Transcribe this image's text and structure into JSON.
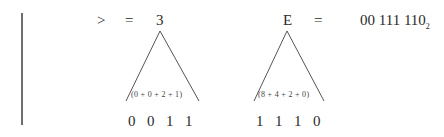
{
  "left_rule": {
    "visible": true
  },
  "row1": {
    "symbol": ">",
    "equals": "=",
    "value": "3",
    "triangle_sum": "(0 + 0 + 2 + 1)",
    "bits": [
      "0",
      "0",
      "1",
      "1"
    ]
  },
  "row2": {
    "symbol": "E",
    "equals": "=",
    "triangle_sum": "(8 + 4 + 2 + 0)",
    "bits": [
      "1",
      "1",
      "1",
      "0"
    ]
  },
  "binary": {
    "value": "00 111 110",
    "subscript": "2"
  }
}
